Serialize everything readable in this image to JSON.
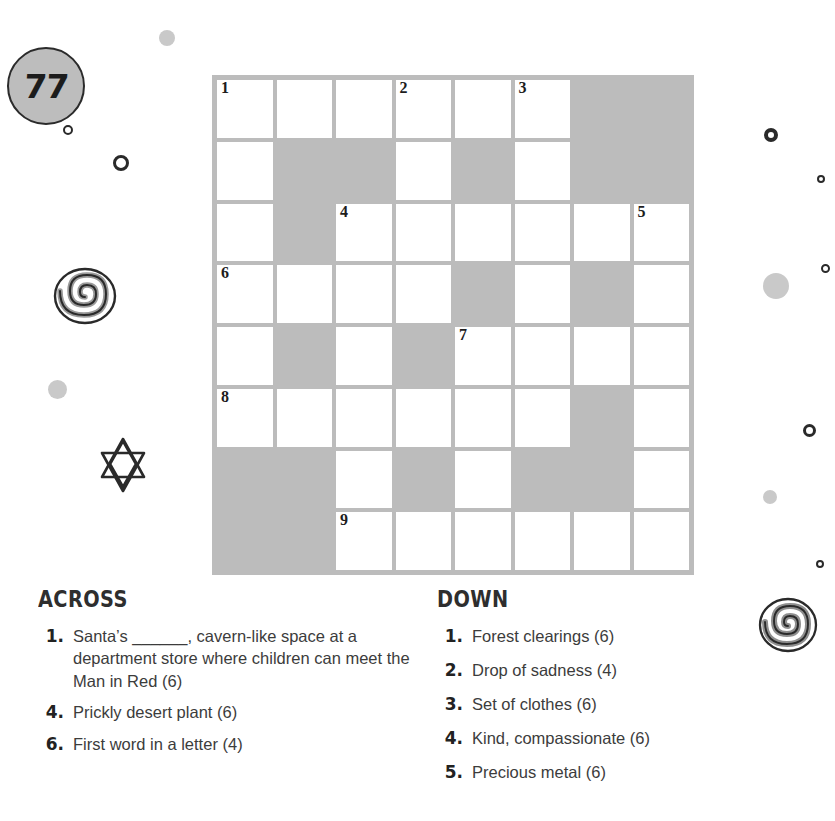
{
  "page": {
    "number": "77"
  },
  "grid": {
    "rows": 8,
    "cols": 8,
    "block_color": "#bcbcbc",
    "cell_color": "#ffffff",
    "cells": [
      [
        {
          "t": "open",
          "n": "1"
        },
        {
          "t": "open",
          "n": ""
        },
        {
          "t": "open",
          "n": ""
        },
        {
          "t": "open",
          "n": "2"
        },
        {
          "t": "open",
          "n": ""
        },
        {
          "t": "open",
          "n": "3"
        },
        {
          "t": "block",
          "n": ""
        },
        {
          "t": "block",
          "n": ""
        }
      ],
      [
        {
          "t": "open",
          "n": ""
        },
        {
          "t": "block",
          "n": ""
        },
        {
          "t": "block",
          "n": ""
        },
        {
          "t": "open",
          "n": ""
        },
        {
          "t": "block",
          "n": ""
        },
        {
          "t": "open",
          "n": ""
        },
        {
          "t": "block",
          "n": ""
        },
        {
          "t": "block",
          "n": ""
        }
      ],
      [
        {
          "t": "open",
          "n": ""
        },
        {
          "t": "block",
          "n": ""
        },
        {
          "t": "open",
          "n": "4"
        },
        {
          "t": "open",
          "n": ""
        },
        {
          "t": "open",
          "n": ""
        },
        {
          "t": "open",
          "n": ""
        },
        {
          "t": "open",
          "n": ""
        },
        {
          "t": "open",
          "n": "5"
        }
      ],
      [
        {
          "t": "open",
          "n": "6"
        },
        {
          "t": "open",
          "n": ""
        },
        {
          "t": "open",
          "n": ""
        },
        {
          "t": "open",
          "n": ""
        },
        {
          "t": "block",
          "n": ""
        },
        {
          "t": "open",
          "n": ""
        },
        {
          "t": "block",
          "n": ""
        },
        {
          "t": "open",
          "n": ""
        }
      ],
      [
        {
          "t": "open",
          "n": ""
        },
        {
          "t": "block",
          "n": ""
        },
        {
          "t": "open",
          "n": ""
        },
        {
          "t": "block",
          "n": ""
        },
        {
          "t": "open",
          "n": "7"
        },
        {
          "t": "open",
          "n": ""
        },
        {
          "t": "open",
          "n": ""
        },
        {
          "t": "open",
          "n": ""
        }
      ],
      [
        {
          "t": "open",
          "n": "8"
        },
        {
          "t": "open",
          "n": ""
        },
        {
          "t": "open",
          "n": ""
        },
        {
          "t": "open",
          "n": ""
        },
        {
          "t": "open",
          "n": ""
        },
        {
          "t": "open",
          "n": ""
        },
        {
          "t": "block",
          "n": ""
        },
        {
          "t": "open",
          "n": ""
        }
      ],
      [
        {
          "t": "block",
          "n": ""
        },
        {
          "t": "block",
          "n": ""
        },
        {
          "t": "open",
          "n": ""
        },
        {
          "t": "block",
          "n": ""
        },
        {
          "t": "open",
          "n": ""
        },
        {
          "t": "block",
          "n": ""
        },
        {
          "t": "block",
          "n": ""
        },
        {
          "t": "open",
          "n": ""
        }
      ],
      [
        {
          "t": "block",
          "n": ""
        },
        {
          "t": "block",
          "n": ""
        },
        {
          "t": "open",
          "n": "9"
        },
        {
          "t": "open",
          "n": ""
        },
        {
          "t": "open",
          "n": ""
        },
        {
          "t": "open",
          "n": ""
        },
        {
          "t": "open",
          "n": ""
        },
        {
          "t": "open",
          "n": ""
        }
      ]
    ]
  },
  "across": {
    "heading": "ACROSS",
    "clues": [
      {
        "n": "1.",
        "text": "Santa’s ______, cavern-like space at a department store where children can meet the Man in Red (6)"
      },
      {
        "n": "4.",
        "text": "Prickly desert plant (6)"
      },
      {
        "n": "6.",
        "text": "First word in a letter (4)"
      }
    ]
  },
  "down": {
    "heading": "DOWN",
    "clues": [
      {
        "n": "1.",
        "text": "Forest clearings (6)"
      },
      {
        "n": "2.",
        "text": "Drop of sadness (4)"
      },
      {
        "n": "3.",
        "text": "Set of clothes (6)"
      },
      {
        "n": "4.",
        "text": "Kind, compassionate (6)"
      },
      {
        "n": "5.",
        "text": "Precious metal (6)"
      }
    ]
  },
  "decorations": {
    "colors": {
      "ink": "#2a2a2a",
      "soft_gray": "#c9c9c9",
      "mid_gray": "#9a9a9a"
    },
    "items": [
      {
        "name": "gray-dot-top-left",
        "shape": "dot-solid",
        "x": 159,
        "y": 30,
        "size": 16
      },
      {
        "name": "small-ring-upper-left",
        "shape": "ring",
        "x": 63,
        "y": 125,
        "size": 10,
        "stroke": 2
      },
      {
        "name": "ring-left",
        "shape": "ring",
        "x": 113,
        "y": 155,
        "size": 16,
        "stroke": 3
      },
      {
        "name": "gray-dot-left",
        "shape": "dot-solid",
        "x": 48,
        "y": 380,
        "size": 19
      },
      {
        "name": "target-ring-right",
        "shape": "ring",
        "x": 764,
        "y": 128,
        "size": 14,
        "stroke": 4
      },
      {
        "name": "tiny-ring-right-top",
        "shape": "ring",
        "x": 817,
        "y": 175,
        "size": 8,
        "stroke": 2
      },
      {
        "name": "tiny-ring-right-mid",
        "shape": "ring",
        "x": 821,
        "y": 264,
        "size": 9,
        "stroke": 2
      },
      {
        "name": "gray-dot-right",
        "shape": "dot-solid",
        "x": 763,
        "y": 273,
        "size": 26
      },
      {
        "name": "ring-right-lower",
        "shape": "ring",
        "x": 803,
        "y": 424,
        "size": 13,
        "stroke": 3
      },
      {
        "name": "gray-dot-right-lower",
        "shape": "dot-solid",
        "x": 763,
        "y": 490,
        "size": 14
      },
      {
        "name": "tiny-ring-right-bottom",
        "shape": "ring",
        "x": 816,
        "y": 560,
        "size": 8,
        "stroke": 2
      }
    ]
  }
}
